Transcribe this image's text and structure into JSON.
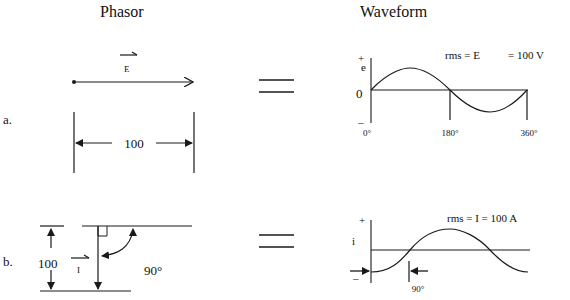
{
  "headers": {
    "phasor": "Phasor",
    "waveform": "Waveform"
  },
  "rows": [
    {
      "label": "a.",
      "phasor": {
        "vector_name": "E",
        "magnitude_label": "100"
      },
      "equals": "=",
      "waveform": {
        "axis_label": "e",
        "plus": "+",
        "minus": "–",
        "zero": "0",
        "rms_text": "rms = E",
        "rms_value": "= 100 V",
        "ticks": [
          "0°",
          "180°",
          "360°"
        ]
      }
    },
    {
      "label": "b.",
      "phasor": {
        "vector_name": "I",
        "magnitude_label": "100",
        "angle_label": "90°"
      },
      "equals": "=",
      "waveform": {
        "axis_label": "i",
        "plus": "+",
        "minus": "–",
        "rms_text": "rms = I = 100 A",
        "shift_label": "90°"
      }
    }
  ],
  "colors": {
    "ink": "#1a1a1a",
    "background": "#ffffff"
  }
}
